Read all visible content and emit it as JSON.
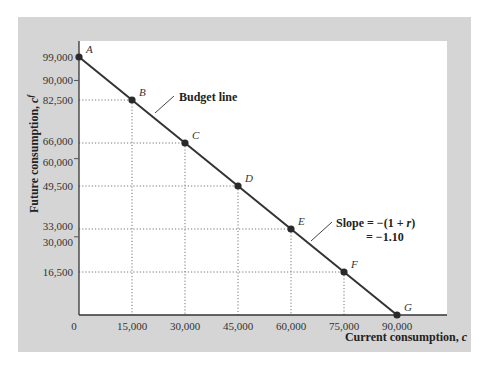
{
  "chart_data": {
    "type": "line",
    "title": "",
    "xlabel": "Current consumption, c",
    "ylabel": "Future consumption, c^f",
    "xlim": [
      0,
      90000
    ],
    "ylim": [
      0,
      99000
    ],
    "grid": false,
    "legend": null,
    "x_ticks": [
      0,
      15000,
      30000,
      45000,
      60000,
      75000,
      90000
    ],
    "x_tick_labels": [
      "0",
      "15,000",
      "30,000",
      "45,000",
      "60,000",
      "75,000",
      "90,000"
    ],
    "y_ticks": [
      16500,
      30000,
      33000,
      49500,
      60000,
      66000,
      82500,
      90000,
      99000
    ],
    "y_tick_labels": [
      "16,500",
      "30,000",
      "33,000",
      "49,500",
      "60,000",
      "66,000",
      "82,500",
      "90,000",
      "99,000"
    ],
    "series": [
      {
        "name": "Budget line",
        "points": [
          {
            "label": "A",
            "x": 0,
            "y": 99000
          },
          {
            "label": "B",
            "x": 15000,
            "y": 82500
          },
          {
            "label": "C",
            "x": 30000,
            "y": 66000
          },
          {
            "label": "D",
            "x": 45000,
            "y": 49500
          },
          {
            "label": "E",
            "x": 60000,
            "y": 33000
          },
          {
            "label": "F",
            "x": 75000,
            "y": 16500
          },
          {
            "label": "G",
            "x": 90000,
            "y": 0
          }
        ]
      }
    ],
    "annotations": [
      {
        "text": "Budget line",
        "target": "line between B and C"
      },
      {
        "text_line1": "Slope = −(1 + r)",
        "text_line2": "= −1.10",
        "target": "line between E and F"
      }
    ],
    "dotted_guides": true
  },
  "labels": {
    "xlabel": "Current consumption, ",
    "xlabel_var": "c",
    "ylabel": "Future consumption, ",
    "ylabel_var": "c",
    "ylabel_sup": "f",
    "budget_line": "Budget line",
    "slope_line1": "Slope = −(1 + ",
    "slope_var": "r",
    "slope_line1_end": ")",
    "slope_line2": "= −1.10"
  },
  "colors": {
    "panel": "#d5d5d5",
    "plot_bg": "#ffffff",
    "line": "#333333",
    "point": "#2a2a2a",
    "guide": "#777777"
  }
}
